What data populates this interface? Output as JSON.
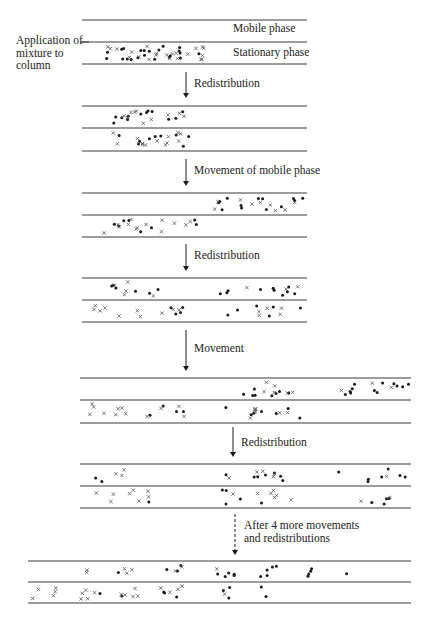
{
  "labels": {
    "mobile_phase": "Mobile phase",
    "stationary_phase": "Stationary phase",
    "application": [
      "Application of",
      "mixture to",
      "column"
    ],
    "step1": "Redistribution",
    "step2": "Movement of mobile phase",
    "step3": "Redistribution",
    "step4": "Movement",
    "step5": "Redistribution",
    "step6": [
      "After 4 more movements",
      "and redistributions"
    ]
  },
  "colors": {
    "line": "#3a3a3a",
    "ink": "#1a1a1a",
    "cross": "#555555"
  },
  "stages": [
    {
      "name": "initial",
      "x1": 82,
      "x2": 307,
      "top": 20,
      "mid": 42,
      "bot": 64,
      "mobile": [],
      "stationary": {
        "region": [
          105,
          208
        ],
        "n_dot": 22,
        "n_cross": 22,
        "seed": 3
      }
    },
    {
      "name": "redistribution-1",
      "x1": 82,
      "x2": 307,
      "top": 106,
      "mid": 128,
      "bot": 151,
      "mobile": {
        "region": [
          110,
          185
        ],
        "n_dot": 12,
        "n_cross": 10,
        "seed": 7
      },
      "stationary": {
        "region": [
          110,
          197
        ],
        "n_dot": 9,
        "n_cross": 13,
        "seed": 11
      }
    },
    {
      "name": "movement-1",
      "x1": 82,
      "x2": 307,
      "top": 193,
      "mid": 215,
      "bot": 237,
      "mobile": {
        "region": [
          214,
          305
        ],
        "n_dot": 13,
        "n_cross": 9,
        "seed": 13
      },
      "stationary": {
        "region": [
          100,
          203
        ],
        "n_dot": 8,
        "n_cross": 13,
        "seed": 17
      }
    },
    {
      "name": "redistribution-2",
      "x1": 82,
      "x2": 307,
      "top": 278,
      "mid": 300,
      "bot": 322,
      "mobile": [
        {
          "region": [
            100,
            160
          ],
          "n_dot": 6,
          "n_cross": 5,
          "seed": 19
        },
        {
          "region": [
            218,
            300
          ],
          "n_dot": 10,
          "n_cross": 3,
          "seed": 23
        }
      ],
      "stationary": [
        {
          "region": [
            94,
            185
          ],
          "n_dot": 4,
          "n_cross": 10,
          "seed": 29
        },
        {
          "region": [
            226,
            302
          ],
          "n_dot": 6,
          "n_cross": 5,
          "seed": 31
        }
      ]
    },
    {
      "name": "movement-2",
      "x1": 80,
      "x2": 411,
      "top": 378,
      "mid": 400,
      "bot": 423,
      "mobile": [
        {
          "region": [
            226,
            298
          ],
          "n_dot": 8,
          "n_cross": 6,
          "seed": 37
        },
        {
          "region": [
            330,
            410
          ],
          "n_dot": 12,
          "n_cross": 3,
          "seed": 41
        }
      ],
      "stationary": [
        {
          "region": [
            84,
            185
          ],
          "n_dot": 4,
          "n_cross": 12,
          "seed": 43
        },
        {
          "region": [
            223,
            300
          ],
          "n_dot": 7,
          "n_cross": 7,
          "seed": 47
        }
      ]
    },
    {
      "name": "redistribution-3",
      "x1": 80,
      "x2": 411,
      "top": 464,
      "mid": 486,
      "bot": 508,
      "mobile": [
        {
          "region": [
            95,
            145
          ],
          "n_dot": 2,
          "n_cross": 3,
          "seed": 53
        },
        {
          "region": [
            224,
            295
          ],
          "n_dot": 7,
          "n_cross": 5,
          "seed": 59
        },
        {
          "region": [
            335,
            411
          ],
          "n_dot": 7,
          "n_cross": 1,
          "seed": 61
        }
      ],
      "stationary": [
        {
          "region": [
            83,
            175
          ],
          "n_dot": 1,
          "n_cross": 8,
          "seed": 67
        },
        {
          "region": [
            222,
            293
          ],
          "n_dot": 5,
          "n_cross": 7,
          "seed": 71
        },
        {
          "region": [
            350,
            400
          ],
          "n_dot": 4,
          "n_cross": 2,
          "seed": 73
        }
      ]
    },
    {
      "name": "final",
      "x1": 28,
      "x2": 411,
      "top": 561,
      "mid": 582,
      "bot": 603,
      "mobile": [
        {
          "region": [
            78,
            90
          ],
          "n_dot": 0,
          "n_cross": 2,
          "seed": 79
        },
        {
          "region": [
            116,
            143
          ],
          "n_dot": 1,
          "n_cross": 3,
          "seed": 83
        },
        {
          "region": [
            165,
            183
          ],
          "n_dot": 3,
          "n_cross": 2,
          "seed": 89
        },
        {
          "region": [
            212,
            240
          ],
          "n_dot": 5,
          "n_cross": 1,
          "seed": 97
        },
        {
          "region": [
            258,
            278
          ],
          "n_dot": 5,
          "n_cross": 0,
          "seed": 101
        },
        {
          "region": [
            301,
            313
          ],
          "n_dot": 4,
          "n_cross": 0,
          "seed": 103
        },
        {
          "region": [
            346,
            350
          ],
          "n_dot": 1,
          "n_cross": 0,
          "seed": 107
        }
      ],
      "stationary": [
        {
          "region": [
            31,
            40
          ],
          "n_dot": 0,
          "n_cross": 2,
          "seed": 109
        },
        {
          "region": [
            53,
            66
          ],
          "n_dot": 0,
          "n_cross": 3,
          "seed": 113
        },
        {
          "region": [
            80,
            103
          ],
          "n_dot": 1,
          "n_cross": 5,
          "seed": 127
        },
        {
          "region": [
            117,
            140
          ],
          "n_dot": 1,
          "n_cross": 5,
          "seed": 131
        },
        {
          "region": [
            159,
            183
          ],
          "n_dot": 3,
          "n_cross": 4,
          "seed": 137
        },
        {
          "region": [
            209,
            232
          ],
          "n_dot": 3,
          "n_cross": 1,
          "seed": 139
        },
        {
          "region": [
            259,
            268
          ],
          "n_dot": 2,
          "n_cross": 0,
          "seed": 149
        }
      ]
    }
  ],
  "arrows": [
    {
      "x": 186,
      "y1": 72,
      "y2": 98,
      "dashed": false
    },
    {
      "x": 186,
      "y1": 159,
      "y2": 186,
      "dashed": false
    },
    {
      "x": 186,
      "y1": 244,
      "y2": 271,
      "dashed": false
    },
    {
      "x": 186,
      "y1": 330,
      "y2": 371,
      "dashed": false
    },
    {
      "x": 233,
      "y1": 427,
      "y2": 457,
      "dashed": false
    },
    {
      "x": 235,
      "y1": 514,
      "y2": 555,
      "dashed": true
    }
  ],
  "application_connector": {
    "x1": 80,
    "x2": 89,
    "y": 42
  }
}
